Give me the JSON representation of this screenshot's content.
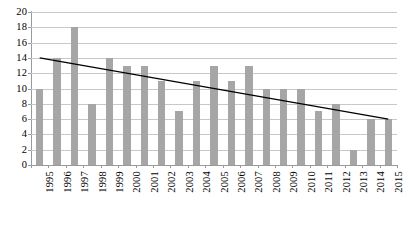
{
  "chart_data": {
    "type": "bar",
    "title": "",
    "subtitle": "",
    "xlabel": "",
    "ylabel": "",
    "categories": [
      "1995",
      "1996",
      "1997",
      "1998",
      "1999",
      "2000",
      "2001",
      "2002",
      "2003",
      "2004",
      "2005",
      "2006",
      "2007",
      "2008",
      "2009",
      "2010",
      "2011",
      "2012",
      "2013",
      "2014",
      "2015"
    ],
    "values": [
      10,
      14,
      18,
      8,
      14,
      13,
      13,
      11,
      7,
      11,
      13,
      11,
      13,
      10,
      10,
      10,
      7,
      8,
      2,
      6,
      6
    ],
    "ylim": [
      0,
      20
    ],
    "ytick_labels": [
      "0",
      "2",
      "4",
      "6",
      "8",
      "10",
      "12",
      "14",
      "16",
      "18",
      "20"
    ],
    "ytick_values": [
      0,
      2,
      4,
      6,
      8,
      10,
      12,
      14,
      16,
      18,
      20
    ],
    "grid": true,
    "legend": "none",
    "series": [
      {
        "name": "bars",
        "type": "bar",
        "color": "#a6a6a6",
        "values": [
          10,
          14,
          18,
          8,
          14,
          13,
          13,
          11,
          7,
          11,
          13,
          11,
          13,
          10,
          10,
          10,
          7,
          8,
          2,
          6,
          6
        ]
      },
      {
        "name": "trendline",
        "type": "line",
        "color": "#000000",
        "start_value": 14.0,
        "end_value": 6.0
      }
    ],
    "colors": {
      "bar": "#a6a6a6",
      "trendline": "#000000",
      "gridline": "#c8c8c8",
      "axis": "#9a9a9a",
      "background": "#ffffff",
      "text": "#000000"
    }
  }
}
